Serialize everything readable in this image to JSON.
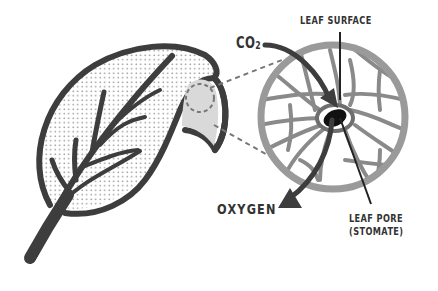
{
  "diagram": {
    "labels": {
      "leaf_surface": "LEAF SURFACE",
      "co2": "CO",
      "co2_subscript": "2",
      "oxygen": "OXYGEN",
      "leaf_pore_line1": "LEAF PORE",
      "leaf_pore_line2": "(STOMATE)"
    },
    "colors": {
      "outline": "#3d3d3d",
      "ring": "#9a9a9a",
      "vein": "#8a8a8a",
      "highlight_fill": "#d9d9d9",
      "stomate": "#111111",
      "stomate_ring": "#6e6e6e",
      "dots": "#8a8a8a"
    }
  }
}
